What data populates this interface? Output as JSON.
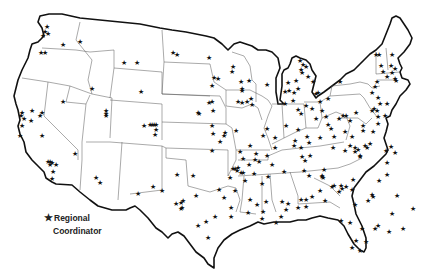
{
  "map": {
    "title": "",
    "region": "Contiguous United States",
    "marker_symbol": "★",
    "legend": {
      "symbol": "★",
      "line1": "Regional",
      "line2": "Coordinator"
    },
    "colors": {
      "outline": "#111111",
      "state_borders": "#555555",
      "markers": "#111111",
      "background": "#ffffff"
    },
    "markers": [
      [
        47,
        26
      ],
      [
        45,
        31
      ],
      [
        48,
        33
      ],
      [
        43,
        35
      ],
      [
        63,
        44
      ],
      [
        41,
        52
      ],
      [
        45,
        52
      ],
      [
        80,
        41
      ],
      [
        92,
        88
      ],
      [
        63,
        101
      ],
      [
        32,
        110
      ],
      [
        22,
        112
      ],
      [
        21,
        115
      ],
      [
        24,
        118
      ],
      [
        42,
        112
      ],
      [
        40,
        115
      ],
      [
        31,
        120
      ],
      [
        22,
        125
      ],
      [
        42,
        135
      ],
      [
        20,
        135
      ],
      [
        106,
        110
      ],
      [
        106,
        113
      ],
      [
        106,
        115
      ],
      [
        48,
        161
      ],
      [
        50,
        161
      ],
      [
        52,
        162
      ],
      [
        56,
        164
      ],
      [
        50,
        164
      ],
      [
        53,
        171
      ],
      [
        52,
        178
      ],
      [
        75,
        153
      ],
      [
        96,
        177
      ],
      [
        100,
        182
      ],
      [
        138,
        193
      ],
      [
        153,
        186
      ],
      [
        124,
        62
      ],
      [
        137,
        62
      ],
      [
        177,
        54
      ],
      [
        209,
        57
      ],
      [
        212,
        85
      ],
      [
        212,
        101
      ],
      [
        199,
        113
      ],
      [
        212,
        125
      ],
      [
        212,
        150
      ],
      [
        141,
        91
      ],
      [
        150,
        124
      ],
      [
        152,
        124
      ],
      [
        154,
        124
      ],
      [
        156,
        124
      ],
      [
        156,
        129
      ],
      [
        155,
        134
      ],
      [
        173,
        52
      ],
      [
        144,
        125
      ],
      [
        214,
        77
      ],
      [
        218,
        78
      ],
      [
        209,
        102
      ],
      [
        198,
        112
      ],
      [
        213,
        110
      ],
      [
        233,
        66
      ],
      [
        232,
        71
      ],
      [
        241,
        81
      ],
      [
        249,
        80
      ],
      [
        242,
        90
      ],
      [
        238,
        101
      ],
      [
        242,
        102
      ],
      [
        247,
        101
      ],
      [
        251,
        98
      ],
      [
        252,
        104
      ],
      [
        250,
        145
      ],
      [
        256,
        153
      ],
      [
        249,
        164
      ],
      [
        243,
        158
      ],
      [
        243,
        172
      ],
      [
        235,
        168
      ],
      [
        233,
        168
      ],
      [
        237,
        170
      ],
      [
        241,
        172
      ],
      [
        230,
        177
      ],
      [
        285,
        91
      ],
      [
        308,
        76
      ],
      [
        313,
        81
      ],
      [
        275,
        137
      ],
      [
        295,
        140
      ],
      [
        275,
        147
      ],
      [
        259,
        161
      ],
      [
        255,
        159
      ],
      [
        267,
        155
      ],
      [
        272,
        164
      ],
      [
        286,
        125
      ],
      [
        213,
        133
      ],
      [
        224,
        135
      ],
      [
        220,
        141
      ],
      [
        225,
        132
      ],
      [
        236,
        130
      ],
      [
        267,
        128
      ],
      [
        263,
        135
      ],
      [
        240,
        151
      ],
      [
        238,
        167
      ],
      [
        306,
        105
      ],
      [
        301,
        113
      ],
      [
        298,
        129
      ],
      [
        307,
        136
      ],
      [
        294,
        145
      ],
      [
        302,
        156
      ],
      [
        305,
        160
      ],
      [
        310,
        155
      ],
      [
        304,
        170
      ],
      [
        242,
        88
      ],
      [
        267,
        84
      ],
      [
        300,
        60
      ],
      [
        303,
        64
      ],
      [
        306,
        66
      ],
      [
        301,
        69
      ],
      [
        302,
        72
      ],
      [
        296,
        80
      ],
      [
        288,
        82
      ],
      [
        298,
        88
      ],
      [
        289,
        90
      ],
      [
        294,
        92
      ],
      [
        293,
        100
      ],
      [
        285,
        103
      ],
      [
        298,
        109
      ],
      [
        316,
        93
      ],
      [
        318,
        92
      ],
      [
        328,
        98
      ],
      [
        320,
        101
      ],
      [
        312,
        108
      ],
      [
        322,
        110
      ],
      [
        316,
        118
      ],
      [
        328,
        124
      ],
      [
        331,
        128
      ],
      [
        320,
        137
      ],
      [
        309,
        142
      ],
      [
        301,
        147
      ],
      [
        340,
        81
      ],
      [
        326,
        116
      ],
      [
        339,
        118
      ],
      [
        343,
        115
      ],
      [
        346,
        115
      ],
      [
        350,
        120
      ],
      [
        356,
        112
      ],
      [
        345,
        131
      ],
      [
        334,
        136
      ],
      [
        352,
        136
      ],
      [
        355,
        147
      ],
      [
        363,
        125
      ],
      [
        363,
        130
      ],
      [
        333,
        147
      ],
      [
        345,
        150
      ],
      [
        350,
        145
      ],
      [
        355,
        151
      ],
      [
        358,
        149
      ],
      [
        360,
        156
      ],
      [
        370,
        143
      ],
      [
        365,
        145
      ],
      [
        367,
        147
      ],
      [
        376,
        54
      ],
      [
        379,
        54
      ],
      [
        381,
        65
      ],
      [
        383,
        71
      ],
      [
        387,
        76
      ],
      [
        392,
        72
      ],
      [
        395,
        78
      ],
      [
        377,
        81
      ],
      [
        375,
        86
      ],
      [
        372,
        92
      ],
      [
        378,
        97
      ],
      [
        380,
        103
      ],
      [
        374,
        108
      ],
      [
        377,
        110
      ],
      [
        385,
        115
      ],
      [
        378,
        123
      ],
      [
        372,
        110
      ],
      [
        378,
        116
      ],
      [
        360,
        155
      ],
      [
        392,
        54
      ],
      [
        391,
        65
      ],
      [
        395,
        68
      ],
      [
        396,
        80
      ],
      [
        387,
        103
      ],
      [
        373,
        131
      ],
      [
        391,
        146
      ],
      [
        386,
        150
      ],
      [
        395,
        152
      ],
      [
        387,
        162
      ],
      [
        387,
        174
      ],
      [
        379,
        180
      ],
      [
        373,
        196
      ],
      [
        397,
        195
      ],
      [
        392,
        213
      ],
      [
        403,
        228
      ],
      [
        389,
        231
      ],
      [
        413,
        208
      ],
      [
        372,
        194
      ],
      [
        368,
        200
      ],
      [
        341,
        220
      ],
      [
        355,
        204
      ],
      [
        352,
        189
      ],
      [
        339,
        191
      ],
      [
        342,
        188
      ],
      [
        341,
        185
      ],
      [
        346,
        186
      ],
      [
        332,
        186
      ],
      [
        334,
        185
      ],
      [
        353,
        179
      ],
      [
        323,
        177
      ],
      [
        320,
        190
      ],
      [
        325,
        200
      ],
      [
        309,
        175
      ],
      [
        324,
        169
      ],
      [
        322,
        176
      ],
      [
        322,
        175
      ],
      [
        312,
        196
      ],
      [
        284,
        171
      ],
      [
        282,
        201
      ],
      [
        288,
        203
      ],
      [
        276,
        222
      ],
      [
        301,
        199
      ],
      [
        306,
        199
      ],
      [
        306,
        206
      ],
      [
        298,
        207
      ],
      [
        286,
        209
      ],
      [
        281,
        216
      ],
      [
        262,
        218
      ],
      [
        263,
        211
      ],
      [
        266,
        201
      ],
      [
        257,
        204
      ],
      [
        219,
        189
      ],
      [
        224,
        197
      ],
      [
        215,
        216
      ],
      [
        206,
        221
      ],
      [
        198,
        225
      ],
      [
        208,
        237
      ],
      [
        176,
        203
      ],
      [
        181,
        202
      ],
      [
        181,
        208
      ],
      [
        183,
        200
      ],
      [
        182,
        207
      ],
      [
        193,
        175
      ],
      [
        177,
        174
      ],
      [
        162,
        190
      ],
      [
        196,
        195
      ],
      [
        231,
        216
      ],
      [
        250,
        199
      ],
      [
        254,
        173
      ],
      [
        268,
        176
      ],
      [
        262,
        183
      ],
      [
        248,
        212
      ],
      [
        231,
        207
      ],
      [
        245,
        180
      ],
      [
        235,
        190
      ],
      [
        350,
        222
      ],
      [
        362,
        228
      ],
      [
        356,
        240
      ],
      [
        352,
        247
      ],
      [
        360,
        250
      ],
      [
        366,
        241
      ],
      [
        375,
        228
      ],
      [
        378,
        225
      ]
    ]
  }
}
